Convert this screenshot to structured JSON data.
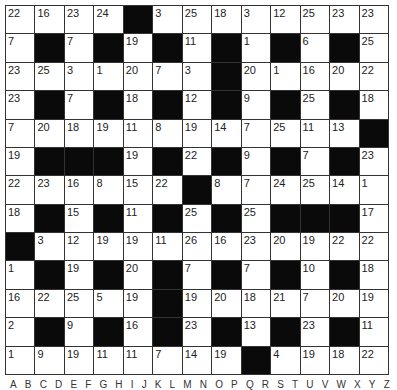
{
  "puzzle": {
    "type": "codeword",
    "rows": 13,
    "cols": 13,
    "grid": [
      [
        "22",
        "16",
        "23",
        "24",
        "#",
        "3",
        "25",
        "18",
        "3",
        "12",
        "25",
        "23",
        "23"
      ],
      [
        "7",
        "#",
        "7",
        "#",
        "19",
        "#",
        "11",
        "#",
        "1",
        "#",
        "6",
        "#",
        "25"
      ],
      [
        "23",
        "25",
        "3",
        "1",
        "20",
        "7",
        "3",
        "#",
        "20",
        "1",
        "16",
        "20",
        "22"
      ],
      [
        "23",
        "#",
        "7",
        "#",
        "18",
        "#",
        "12",
        "#",
        "9",
        "#",
        "25",
        "#",
        "18"
      ],
      [
        "7",
        "20",
        "18",
        "19",
        "11",
        "8",
        "19",
        "14",
        "7",
        "25",
        "11",
        "13",
        "#"
      ],
      [
        "19",
        "#",
        "#",
        "#",
        "19",
        "#",
        "22",
        "#",
        "9",
        "#",
        "7",
        "#",
        "23"
      ],
      [
        "22",
        "23",
        "16",
        "8",
        "15",
        "22",
        "#",
        "8",
        "7",
        "24",
        "25",
        "14",
        "1"
      ],
      [
        "18",
        "#",
        "15",
        "#",
        "11",
        "#",
        "25",
        "#",
        "25",
        "#",
        "#",
        "#",
        "17"
      ],
      [
        "#",
        "3",
        "12",
        "19",
        "19",
        "11",
        "26",
        "16",
        "23",
        "20",
        "19",
        "22",
        "22"
      ],
      [
        "1",
        "#",
        "19",
        "#",
        "20",
        "#",
        "7",
        "#",
        "7",
        "#",
        "10",
        "#",
        "18"
      ],
      [
        "16",
        "22",
        "25",
        "5",
        "19",
        "#",
        "19",
        "20",
        "18",
        "21",
        "7",
        "20",
        "19"
      ],
      [
        "2",
        "#",
        "9",
        "#",
        "16",
        "#",
        "23",
        "#",
        "13",
        "#",
        "23",
        "#",
        "11"
      ],
      [
        "1",
        "9",
        "19",
        "11",
        "11",
        "7",
        "14",
        "19",
        "#",
        "4",
        "19",
        "18",
        "22"
      ]
    ],
    "alphabet": [
      "A",
      "B",
      "C",
      "D",
      "E",
      "F",
      "G",
      "H",
      "I",
      "J",
      "K",
      "L",
      "M",
      "N",
      "O",
      "P",
      "Q",
      "R",
      "S",
      "T",
      "U",
      "V",
      "W",
      "X",
      "Y",
      "Z"
    ]
  },
  "colors": {
    "black_cell": "#0a0a0a",
    "white_cell": "#ffffff",
    "grid_line": "#333333"
  }
}
